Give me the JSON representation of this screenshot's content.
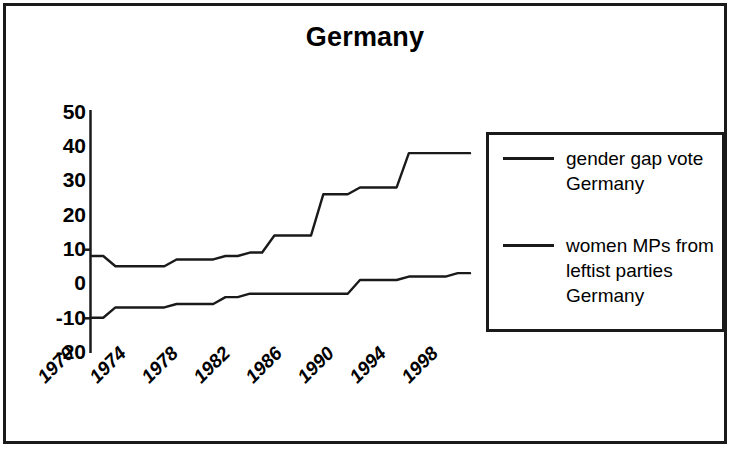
{
  "chart": {
    "title": "Germany"
  },
  "legend": {
    "entries": [
      {
        "label": "gender gap vote\nGermany"
      },
      {
        "label": "women MPs from\nleftist parties\nGermany"
      }
    ]
  },
  "chart_data": {
    "type": "line",
    "title": "Germany",
    "xlabel": "",
    "ylabel": "",
    "grid": false,
    "legend_position": "right",
    "ylim": [
      -20,
      50
    ],
    "ytick_labels": [
      "50",
      "40",
      "30",
      "20",
      "10",
      "0",
      "-10",
      "-20"
    ],
    "ytick_values": [
      50,
      40,
      30,
      20,
      10,
      0,
      -10,
      -20
    ],
    "xlim": [
      1969,
      2000
    ],
    "xtick_labels": [
      "1970",
      "1974",
      "1978",
      "1982",
      "1986",
      "1990",
      "1994",
      "1998"
    ],
    "xtick_values": [
      1970,
      1974,
      1978,
      1982,
      1986,
      1990,
      1994,
      1998
    ],
    "x": [
      1969,
      1970,
      1971,
      1972,
      1973,
      1974,
      1975,
      1976,
      1977,
      1978,
      1979,
      1980,
      1981,
      1982,
      1983,
      1984,
      1985,
      1986,
      1987,
      1988,
      1989,
      1990,
      1991,
      1992,
      1993,
      1994,
      1995,
      1996,
      1997,
      1998,
      1999,
      2000
    ],
    "series": [
      {
        "name": "gender gap vote Germany",
        "color": "#1a1a1a",
        "values": [
          8,
          8,
          5,
          5,
          5,
          5,
          5,
          7,
          7,
          7,
          7,
          8,
          8,
          9,
          9,
          14,
          14,
          14,
          14,
          26,
          26,
          26,
          28,
          28,
          28,
          28,
          38,
          38,
          38,
          38,
          38,
          38
        ]
      },
      {
        "name": "women MPs from leftist parties Germany",
        "color": "#1a1a1a",
        "values": [
          -10,
          -10,
          -7,
          -7,
          -7,
          -7,
          -7,
          -6,
          -6,
          -6,
          -6,
          -4,
          -4,
          -3,
          -3,
          -3,
          -3,
          -3,
          -3,
          -3,
          -3,
          -3,
          1,
          1,
          1,
          1,
          2,
          2,
          2,
          2,
          3,
          3
        ]
      }
    ]
  }
}
